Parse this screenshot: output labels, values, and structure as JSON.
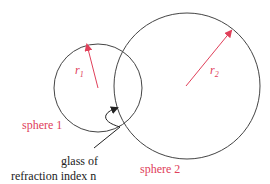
{
  "colors": {
    "accent": "#e0405a",
    "line": "#444444",
    "text": "#222222"
  },
  "labels": {
    "r1": "r",
    "r1_sub": "1",
    "r2": "r",
    "r2_sub": "2",
    "sphere1": "sphere 1",
    "sphere2": "sphere 2",
    "glass_line1": "glass of",
    "glass_line2": "refraction index n"
  }
}
